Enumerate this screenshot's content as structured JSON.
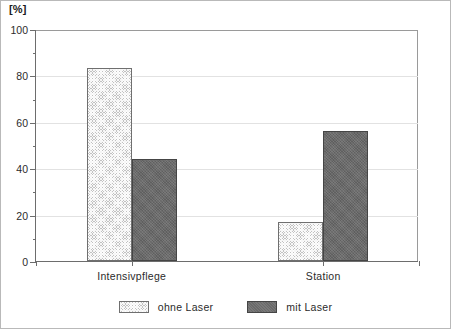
{
  "chart_data": {
    "type": "bar",
    "title": "",
    "subtitle": "",
    "xlabel": "",
    "ylabel": "[%]",
    "ylim": [
      0,
      100
    ],
    "ytick_labels": [
      "0",
      "20",
      "40",
      "60",
      "80",
      "100"
    ],
    "ytick_values": [
      0,
      20,
      40,
      60,
      80,
      100
    ],
    "yminor_values": [
      10,
      30,
      50,
      70,
      90
    ],
    "grid": "horizontal",
    "legend_position": "bottom-center",
    "categories": [
      "Intensivpflege",
      "Station"
    ],
    "series": [
      {
        "name": "ohne Laser",
        "values": [
          83,
          17
        ],
        "fill": "light-crosshatch",
        "color": "#c2c2c2"
      },
      {
        "name": "mit Laser",
        "values": [
          44,
          56
        ],
        "fill": "solid-dark",
        "color": "#6a6a6a"
      }
    ]
  },
  "legend": {
    "items": [
      {
        "label": "ohne Laser",
        "swatch": "light-crosshatch-swatch"
      },
      {
        "label": "mit Laser",
        "swatch": "dark-solid-swatch"
      }
    ]
  },
  "axis": {
    "y_unit_label": "[%]"
  }
}
